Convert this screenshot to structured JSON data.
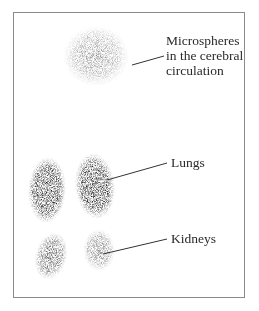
{
  "figure": {
    "labels": {
      "cerebral": [
        "Microspheres",
        "in the cerebral",
        "circulation"
      ],
      "lungs": "Lungs",
      "kidneys": "Kidneys"
    },
    "regions": [
      {
        "name": "cerebral-circulation",
        "intensity": "low"
      },
      {
        "name": "left-lung",
        "intensity": "high"
      },
      {
        "name": "right-lung",
        "intensity": "high"
      },
      {
        "name": "left-kidney",
        "intensity": "medium"
      },
      {
        "name": "right-kidney",
        "intensity": "low-medium"
      }
    ]
  }
}
